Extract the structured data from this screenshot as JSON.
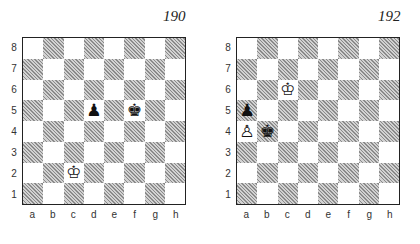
{
  "files": [
    "a",
    "b",
    "c",
    "d",
    "e",
    "f",
    "g",
    "h"
  ],
  "ranks": [
    "8",
    "7",
    "6",
    "5",
    "4",
    "3",
    "2",
    "1"
  ],
  "glyphs": {
    "white-king": "♔",
    "white-pawn": "♙",
    "black-king": "♚",
    "black-pawn": "♟"
  },
  "diagrams": [
    {
      "number": "190",
      "pieces": [
        {
          "square": "c2",
          "piece": "white-king"
        },
        {
          "square": "d5",
          "piece": "black-pawn"
        },
        {
          "square": "f5",
          "piece": "black-king"
        }
      ]
    },
    {
      "number": "192",
      "pieces": [
        {
          "square": "c6",
          "piece": "white-king"
        },
        {
          "square": "a5",
          "piece": "black-pawn"
        },
        {
          "square": "a4",
          "piece": "white-pawn"
        },
        {
          "square": "b4",
          "piece": "black-king"
        }
      ]
    }
  ]
}
